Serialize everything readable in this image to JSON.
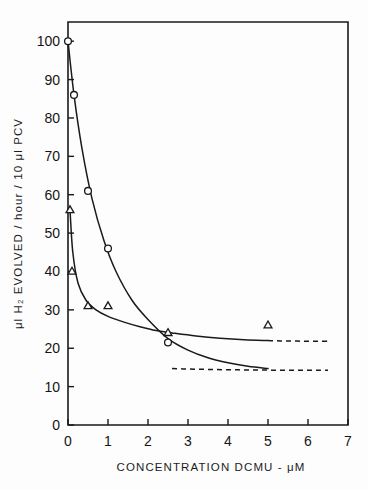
{
  "figure": {
    "name": "dcmu-hydrogen-evolution-plot",
    "background_color": "#fdfdfd",
    "ink_color": "#1a1a1a"
  },
  "chart_data": {
    "type": "line",
    "title": "",
    "subtitle": "",
    "xlabel": "CONCENTRATION  DCMU -  μM",
    "ylabel": "μl H₂ EVOLVED / hour / 10 μl PCV",
    "xlim": [
      0,
      7
    ],
    "ylim": [
      0,
      105
    ],
    "grid": false,
    "legend": "none",
    "xticks": [
      0,
      1,
      2,
      3,
      4,
      5,
      6,
      7
    ],
    "xticklabels": [
      "0",
      "1",
      "2",
      "3",
      "4",
      "5",
      "6",
      "7"
    ],
    "yticks": [
      0,
      10,
      20,
      30,
      40,
      50,
      60,
      70,
      80,
      90,
      100
    ],
    "yticklabels": [
      "0",
      "10",
      "20",
      "30",
      "40",
      "50",
      "60",
      "70",
      "80",
      "90",
      "100"
    ],
    "frame": "box",
    "series": [
      {
        "name": "circle-series",
        "marker": "open-circle",
        "linestyle": "solid-then-dashed",
        "x": [
          0,
          0.15,
          0.5,
          1.0,
          2.5
        ],
        "values": [
          100,
          86,
          61,
          46,
          21.5
        ],
        "curve_x": [
          0,
          0.15,
          0.35,
          0.6,
          0.9,
          1.2,
          1.6,
          2.0,
          2.5,
          3.0,
          3.5,
          4.0,
          4.5,
          5.0
        ],
        "curve_y": [
          100,
          86,
          72,
          59,
          48,
          40,
          32.5,
          27.5,
          22.5,
          19.5,
          17.5,
          16.2,
          15.3,
          14.7
        ],
        "dashed_from_x": 2.6,
        "dashed_to_x": 6.5,
        "asymptote": 14.2
      },
      {
        "name": "triangle-series",
        "marker": "open-triangle",
        "linestyle": "solid-then-dashed",
        "x": [
          0.05,
          0.1,
          0.5,
          1.0,
          2.5,
          5.0
        ],
        "values": [
          56,
          40,
          31,
          31,
          24,
          26
        ],
        "curve_x": [
          0.05,
          0.12,
          0.25,
          0.45,
          0.7,
          1.0,
          1.4,
          1.8,
          2.2,
          2.6,
          3.2,
          3.8,
          4.4,
          5.0
        ],
        "curve_y": [
          56,
          45,
          37,
          32.5,
          30,
          28.3,
          26.8,
          25.6,
          24.6,
          24.0,
          23.2,
          22.6,
          22.2,
          22.0
        ],
        "dashed_from_x": 5.0,
        "dashed_to_x": 6.5,
        "asymptote": 21.8
      }
    ],
    "annotations": []
  }
}
